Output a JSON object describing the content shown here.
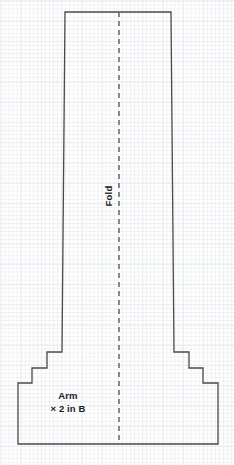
{
  "sheet": {
    "width": 234,
    "height": 465,
    "background_color": "#ffffff"
  },
  "grid": {
    "name": "graph-paper-grid",
    "minor_line_color": "#edeff2",
    "minor_spacing_px": 4.05,
    "major_line_color": "#e2e5ea",
    "major_spacing_px": 20.25
  },
  "pattern_piece": {
    "name": "Arm",
    "quantity_label": "× 2 in B",
    "outline_color": "#4a4a4a",
    "outline_width": 1.3,
    "fill_color": "none",
    "outline_points": "65,12 171,12 174,352 189,352 189,368 203,368 203,383 218,383 218,444 18,444 18,383 32,383 32,368 47,368 47,352 62,352",
    "description": "Tapered arm sleeve pattern with stepped shoulder shaping, cut on fold"
  },
  "fold_line": {
    "label": "Fold",
    "color": "#6d6d6d",
    "x_position": 119,
    "y_start": 12,
    "y_end": 444,
    "dash_length": 5,
    "gap_length": 4,
    "width": 1.6,
    "label_rotation_deg": -90
  }
}
